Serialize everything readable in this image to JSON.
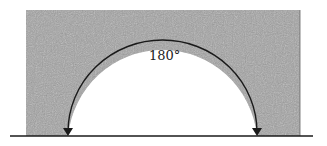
{
  "diagram": {
    "angle_label": "180°",
    "colors": {
      "fill": "#9a9a9a",
      "stroke": "#1a1a1a",
      "background": "#ffffff"
    }
  }
}
